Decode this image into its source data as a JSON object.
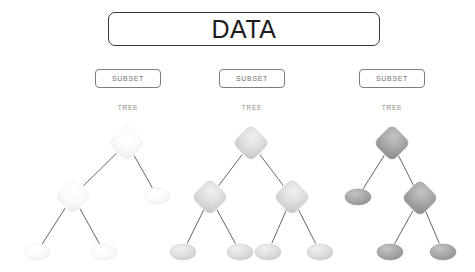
{
  "diagram": {
    "title": "DATA",
    "type": "ensemble-tree-diagram",
    "root_box": {
      "label": "DATA",
      "shape": "rounded-rectangle",
      "border_color": "#3a3a3a",
      "fill": "#ffffff"
    },
    "branches": [
      {
        "subset_label": "SUBSET",
        "tree_label": "TREE",
        "tone": "#f4f4f4",
        "tree": {
          "nodes": [
            {
              "id": "r",
              "shape": "diamond",
              "cx": 127,
              "cy": 143,
              "w": 26,
              "h": 26,
              "fill": "#fbfbfb"
            },
            {
              "id": "l",
              "shape": "diamond",
              "cx": 73,
              "cy": 196,
              "w": 26,
              "h": 26,
              "fill": "#fbfbfb"
            },
            {
              "id": "rr",
              "shape": "ellipse",
              "cx": 157,
              "cy": 196,
              "w": 26,
              "h": 16,
              "fill": "#fcfcfc"
            },
            {
              "id": "ll",
              "shape": "ellipse",
              "cx": 37,
              "cy": 252,
              "w": 26,
              "h": 16,
              "fill": "#fbfbfb"
            },
            {
              "id": "lr",
              "shape": "ellipse",
              "cx": 104,
              "cy": 252,
              "w": 26,
              "h": 16,
              "fill": "#fbfbfb"
            }
          ],
          "edges": [
            [
              "r",
              "l"
            ],
            [
              "r",
              "rr"
            ],
            [
              "l",
              "ll"
            ],
            [
              "l",
              "lr"
            ]
          ]
        }
      },
      {
        "subset_label": "SUBSET",
        "tree_label": "TREE",
        "tone": "#dcdcdc",
        "tree": {
          "nodes": [
            {
              "id": "r",
              "shape": "diamond",
              "cx": 251,
              "cy": 143,
              "w": 26,
              "h": 26,
              "fill": "#dedede"
            },
            {
              "id": "l",
              "shape": "diamond",
              "cx": 210,
              "cy": 197,
              "w": 26,
              "h": 26,
              "fill": "#dcdcdc"
            },
            {
              "id": "rt",
              "shape": "diamond",
              "cx": 292,
              "cy": 197,
              "w": 26,
              "h": 26,
              "fill": "#dedede"
            },
            {
              "id": "ll",
              "shape": "ellipse",
              "cx": 183,
              "cy": 252,
              "w": 26,
              "h": 16,
              "fill": "#dcdcdc"
            },
            {
              "id": "lr",
              "shape": "ellipse",
              "cx": 240,
              "cy": 252,
              "w": 26,
              "h": 16,
              "fill": "#dcdcdc"
            },
            {
              "id": "rl",
              "shape": "ellipse",
              "cx": 268,
              "cy": 252,
              "w": 26,
              "h": 16,
              "fill": "#dcdcdc"
            },
            {
              "id": "rr",
              "shape": "ellipse",
              "cx": 320,
              "cy": 252,
              "w": 26,
              "h": 16,
              "fill": "#dcdcdc"
            }
          ],
          "edges": [
            [
              "r",
              "l"
            ],
            [
              "r",
              "rt"
            ],
            [
              "l",
              "ll"
            ],
            [
              "l",
              "lr"
            ],
            [
              "rt",
              "rl"
            ],
            [
              "rt",
              "rr"
            ]
          ]
        }
      },
      {
        "subset_label": "SUBSET",
        "tree_label": "TREE",
        "tone": "#a8a8a8",
        "tree": {
          "nodes": [
            {
              "id": "r",
              "shape": "diamond",
              "cx": 392,
              "cy": 143,
              "w": 26,
              "h": 26,
              "fill": "#a9a9a9"
            },
            {
              "id": "l",
              "shape": "ellipse",
              "cx": 358,
              "cy": 197,
              "w": 26,
              "h": 16,
              "fill": "#a6a6a6"
            },
            {
              "id": "rt",
              "shape": "diamond",
              "cx": 420,
              "cy": 198,
              "w": 26,
              "h": 26,
              "fill": "#a9a9a9"
            },
            {
              "id": "rl",
              "shape": "ellipse",
              "cx": 390,
              "cy": 252,
              "w": 26,
              "h": 16,
              "fill": "#a6a6a6"
            },
            {
              "id": "rr",
              "shape": "ellipse",
              "cx": 443,
              "cy": 252,
              "w": 26,
              "h": 16,
              "fill": "#a6a6a6"
            }
          ],
          "edges": [
            [
              "r",
              "l"
            ],
            [
              "r",
              "rt"
            ],
            [
              "rt",
              "rl"
            ],
            [
              "rt",
              "rr"
            ]
          ]
        }
      }
    ],
    "colors": {
      "background": "#ffffff",
      "edge": "#555555",
      "text_dark": "#1c1c1c",
      "text_muted": "#6f6f6f",
      "box_border": "#7d7d7d"
    }
  }
}
